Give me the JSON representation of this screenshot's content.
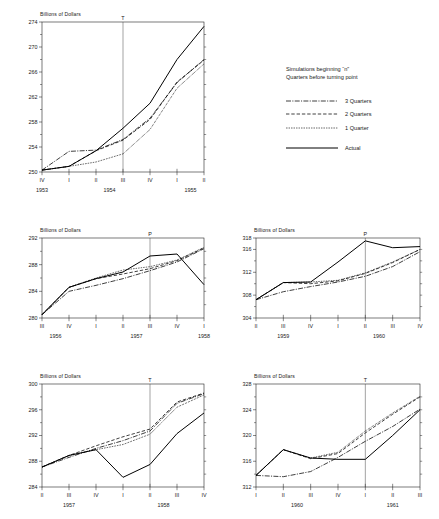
{
  "figure": {
    "y_axis_title": "Billions of Dollars",
    "legend": {
      "heading_line1": "Simulations beginning “n”",
      "heading_line2": "Quarters before turning point",
      "entries": [
        {
          "label": "3 Quarters",
          "style": "dash-dot"
        },
        {
          "label": "2 Quarters",
          "style": "dashed"
        },
        {
          "label": "1 Quarter",
          "style": "dotted"
        },
        {
          "label": "Actual",
          "style": "solid"
        }
      ]
    }
  },
  "chart_data": [
    {
      "id": "panel-1953-1955",
      "type": "line",
      "title": "",
      "ylabel": "Billions of Dollars",
      "xlabel": "",
      "grid": false,
      "ylim": [
        250,
        274
      ],
      "yticks": [
        250,
        254,
        258,
        262,
        266,
        270,
        274
      ],
      "yminor": [
        252,
        256,
        260,
        264,
        268,
        272
      ],
      "x": [
        "IV",
        "I",
        "II",
        "III",
        "IV",
        "I",
        "II"
      ],
      "year_groups": [
        {
          "label": "1953",
          "start": 0,
          "end": 0
        },
        {
          "label": "1954",
          "start": 1,
          "end": 4
        },
        {
          "label": "1955",
          "start": 5,
          "end": 6
        }
      ],
      "marker": {
        "label": "T",
        "x_index": 3
      },
      "series": [
        {
          "name": "Actual",
          "style": "solid",
          "values": [
            250.3,
            250.9,
            253.4,
            257.0,
            261.0,
            268.0,
            273.3
          ]
        },
        {
          "name": "3 Quarters",
          "style": "dash-dot",
          "values": [
            250.3,
            253.3,
            253.5,
            255.2,
            258.6,
            264.3,
            268.0
          ]
        },
        {
          "name": "2 Quarters",
          "style": "dashed",
          "values": [
            250.3,
            250.9,
            253.4,
            255.1,
            258.4,
            264.4,
            267.9
          ]
        },
        {
          "name": "1 Quarter",
          "style": "dotted",
          "values": [
            250.3,
            250.9,
            251.6,
            252.9,
            256.8,
            263.4,
            267.3
          ]
        }
      ]
    },
    {
      "id": "panel-1956-1958",
      "type": "line",
      "title": "",
      "ylabel": "Billions of Dollars",
      "xlabel": "",
      "grid": false,
      "ylim": [
        280,
        292
      ],
      "yticks": [
        280,
        284,
        288,
        292
      ],
      "yminor": [
        282,
        286,
        290
      ],
      "x": [
        "III",
        "IV",
        "I",
        "II",
        "III",
        "IV",
        "I"
      ],
      "year_groups": [
        {
          "label": "1956",
          "start": 0,
          "end": 1
        },
        {
          "label": "1957",
          "start": 2,
          "end": 5
        },
        {
          "label": "1958",
          "start": 6,
          "end": 6
        }
      ],
      "marker": {
        "label": "P",
        "x_index": 4
      },
      "series": [
        {
          "name": "Actual",
          "style": "solid",
          "values": [
            280.5,
            284.6,
            285.9,
            286.9,
            289.3,
            289.6,
            285.0
          ]
        },
        {
          "name": "3 Quarters",
          "style": "dash-dot",
          "values": [
            280.5,
            284.0,
            284.9,
            285.9,
            287.1,
            288.4,
            290.4
          ]
        },
        {
          "name": "2 Quarters",
          "style": "dashed",
          "values": [
            280.5,
            284.6,
            285.9,
            286.6,
            287.4,
            288.6,
            290.5
          ]
        },
        {
          "name": "1 Quarter",
          "style": "dotted",
          "values": [
            280.5,
            284.6,
            286.0,
            287.2,
            287.7,
            288.7,
            290.6
          ]
        }
      ]
    },
    {
      "id": "panel-1959-1960",
      "type": "line",
      "title": "",
      "ylabel": "Billions of Dollars",
      "xlabel": "",
      "grid": false,
      "ylim": [
        304,
        318
      ],
      "yticks": [
        304,
        308,
        312,
        316,
        318
      ],
      "yminor": [
        306,
        310,
        314
      ],
      "x": [
        "II",
        "III",
        "IV",
        "I",
        "II",
        "III",
        "IV"
      ],
      "year_groups": [
        {
          "label": "1959",
          "start": 0,
          "end": 2
        },
        {
          "label": "1960",
          "start": 3,
          "end": 6
        }
      ],
      "marker": {
        "label": "P",
        "x_index": 4
      },
      "series": [
        {
          "name": "Actual",
          "style": "solid",
          "values": [
            307.2,
            310.2,
            310.3,
            313.8,
            317.5,
            316.3,
            316.5
          ]
        },
        {
          "name": "3 Quarters",
          "style": "dash-dot",
          "values": [
            307.2,
            308.6,
            309.5,
            310.3,
            311.3,
            313.0,
            315.6
          ]
        },
        {
          "name": "2 Quarters",
          "style": "dashed",
          "values": [
            307.2,
            310.2,
            310.0,
            310.5,
            311.8,
            313.7,
            316.0
          ]
        },
        {
          "name": "1 Quarter",
          "style": "dotted",
          "values": [
            307.2,
            310.2,
            310.3,
            310.6,
            311.9,
            313.8,
            316.0
          ]
        }
      ]
    },
    {
      "id": "panel-1957-1958",
      "type": "line",
      "title": "",
      "ylabel": "Billions of Dollars",
      "xlabel": "",
      "grid": false,
      "ylim": [
        284,
        300
      ],
      "yticks": [
        284,
        288,
        292,
        296,
        300
      ],
      "yminor": [
        286,
        290,
        294,
        298
      ],
      "x": [
        "II",
        "III",
        "IV",
        "I",
        "II",
        "III",
        "IV"
      ],
      "year_groups": [
        {
          "label": "1957",
          "start": 0,
          "end": 2
        },
        {
          "label": "1958",
          "start": 3,
          "end": 6
        }
      ],
      "marker": {
        "label": "T",
        "x_index": 4
      },
      "series": [
        {
          "name": "Actual",
          "style": "solid",
          "values": [
            287.1,
            288.9,
            289.8,
            285.5,
            287.5,
            292.3,
            295.5
          ]
        },
        {
          "name": "3 Quarters",
          "style": "dash-dot",
          "values": [
            287.1,
            288.6,
            290.0,
            291.2,
            292.7,
            297.0,
            298.5
          ]
        },
        {
          "name": "2 Quarters",
          "style": "dashed",
          "values": [
            287.1,
            288.9,
            290.4,
            291.8,
            293.0,
            297.2,
            298.6
          ]
        },
        {
          "name": "1 Quarter",
          "style": "dotted",
          "values": [
            287.1,
            288.9,
            289.8,
            290.6,
            292.2,
            296.4,
            298.3
          ]
        }
      ]
    },
    {
      "id": "panel-1960-1961",
      "type": "line",
      "title": "",
      "ylabel": "Billions of Dollars",
      "xlabel": "",
      "grid": false,
      "ylim": [
        312,
        328
      ],
      "yticks": [
        312,
        316,
        320,
        324,
        328
      ],
      "yminor": [
        314,
        318,
        322,
        326
      ],
      "x": [
        "I",
        "II",
        "III",
        "IV",
        "I",
        "II",
        "III"
      ],
      "year_groups": [
        {
          "label": "1960",
          "start": 0,
          "end": 3
        },
        {
          "label": "1961",
          "start": 4,
          "end": 6
        }
      ],
      "marker": {
        "label": "T",
        "x_index": 4
      },
      "series": [
        {
          "name": "Actual",
          "style": "solid",
          "values": [
            313.8,
            317.8,
            316.5,
            316.3,
            316.3,
            320.0,
            324.0
          ]
        },
        {
          "name": "3 Quarters",
          "style": "dash-dot",
          "values": [
            313.8,
            313.6,
            314.4,
            316.6,
            319.1,
            321.4,
            324.1
          ]
        },
        {
          "name": "2 Quarters",
          "style": "dashed",
          "values": [
            313.8,
            317.8,
            316.4,
            317.2,
            320.4,
            323.3,
            326.0
          ]
        },
        {
          "name": "1 Quarter",
          "style": "dotted",
          "values": [
            313.8,
            317.8,
            316.5,
            317.4,
            320.7,
            323.5,
            326.1
          ]
        }
      ]
    }
  ]
}
